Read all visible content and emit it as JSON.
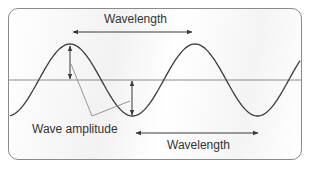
{
  "labels": {
    "wavelength_top": "Wavelength",
    "wavelength_bottom": "Wavelength",
    "amplitude": "Wave amplitude"
  },
  "colors": {
    "wave": "#3a3a3a",
    "midline": "#8a8a8a",
    "arrow": "#3a3a3a",
    "leader": "#8a8a8a",
    "frame": "#8a8a8a"
  },
  "wave": {
    "midline_y": 80,
    "amplitude_px": 36,
    "period_px": 125,
    "first_peak_x": 70
  }
}
